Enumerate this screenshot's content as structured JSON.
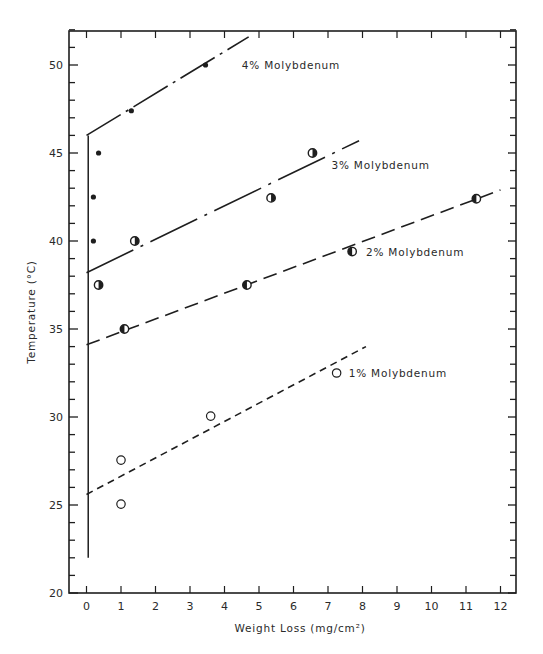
{
  "chart_data": {
    "type": "scatter",
    "title": "",
    "xlabel": "Weight Loss (mg/cm²)",
    "ylabel": "Temperature (°C)",
    "xlim": [
      -0.5,
      12.5
    ],
    "ylim": [
      20,
      52
    ],
    "x_ticks": [
      0,
      1,
      2,
      3,
      4,
      5,
      6,
      7,
      8,
      9,
      10,
      11,
      12
    ],
    "y_ticks": [
      20,
      25,
      30,
      35,
      40,
      45,
      50
    ],
    "y_minor_step": 1,
    "grid": false,
    "legend": "inline labels beside each fit line",
    "series": [
      {
        "name": "4% Molybdenum",
        "marker": "filled-dot",
        "points": [
          [
            0.2,
            40.0
          ],
          [
            0.2,
            42.5
          ],
          [
            0.35,
            45.0
          ],
          [
            1.3,
            47.4
          ],
          [
            3.45,
            50.0
          ]
        ],
        "fit_line": {
          "style": "long-dash-dot",
          "x": [
            0,
            4.7
          ],
          "y": [
            46.0,
            51.6
          ]
        },
        "label_pos": [
          4.5,
          50.0
        ]
      },
      {
        "name": "3% Molybdenum",
        "marker": "half-filled-circle",
        "points": [
          [
            0.35,
            37.5
          ],
          [
            1.4,
            40.0
          ],
          [
            5.35,
            42.45
          ],
          [
            6.55,
            45.0
          ]
        ],
        "fit_line": {
          "style": "dash-dot",
          "x": [
            0,
            7.9
          ],
          "y": [
            38.2,
            45.7
          ]
        },
        "label_pos": [
          7.1,
          44.3
        ]
      },
      {
        "name": "2% Molybdenum",
        "marker": "half-filled-circle-left",
        "points": [
          [
            1.1,
            35.0
          ],
          [
            4.65,
            37.5
          ],
          [
            7.7,
            39.4
          ],
          [
            11.3,
            42.4
          ]
        ],
        "fit_line": {
          "style": "long-dash",
          "x": [
            0,
            12
          ],
          "y": [
            34.1,
            42.9
          ]
        },
        "label_pos": [
          8.1,
          39.4
        ]
      },
      {
        "name": "1% Molybdenum",
        "marker": "open-circle",
        "points": [
          [
            1.0,
            25.05
          ],
          [
            1.0,
            27.55
          ],
          [
            3.6,
            30.05
          ],
          [
            7.25,
            32.5
          ]
        ],
        "fit_line": {
          "style": "short-dash",
          "x": [
            0,
            8.1
          ],
          "y": [
            25.6,
            34.0
          ]
        },
        "label_pos": [
          7.6,
          32.5
        ]
      }
    ],
    "vertical_line": {
      "x": 0.05,
      "y": [
        22,
        46
      ]
    }
  }
}
